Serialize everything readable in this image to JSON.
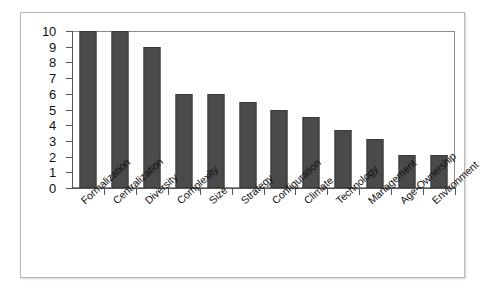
{
  "figure": {
    "frame_border_color": "#b9b9b9",
    "background_color": "#ffffff"
  },
  "chart_data": {
    "type": "bar",
    "title": "",
    "subtitle": "",
    "xlabel": "",
    "ylabel": "",
    "categories": [
      "Formalization",
      "Centralization",
      "Diversity",
      "Complexity",
      "Size",
      "Strategy",
      "Configuration",
      "Climate",
      "Technology",
      "Management",
      "Age-Ownership",
      "Environment"
    ],
    "values": [
      10,
      10,
      9,
      6,
      6,
      5.5,
      5,
      4.5,
      3.7,
      3.1,
      2.1,
      2.1
    ],
    "ylim": [
      0,
      10
    ],
    "ytick_labels": [
      "10",
      "9",
      "8",
      "7",
      "6",
      "5",
      "4",
      "3",
      "2",
      "1",
      "0"
    ],
    "ytick_values": [
      10,
      9,
      8,
      7,
      6,
      5,
      4,
      3,
      2,
      1,
      0
    ],
    "grid": false,
    "legend": false,
    "legend_position": "none",
    "bar_color": "#4a4a4a",
    "bar_edge_color": "#3a3a3a",
    "axis_color": "#555555",
    "label_rotation_degrees": -42
  }
}
